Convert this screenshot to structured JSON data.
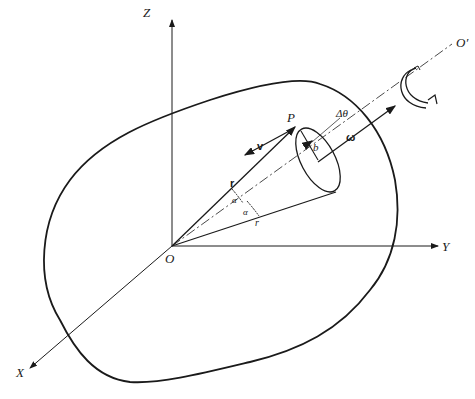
{
  "diagram": {
    "type": "rigid-body-rotation-vector-diagram",
    "colors": {
      "stroke": "#1a1a1a",
      "background": "#ffffff"
    },
    "axes": {
      "z": "Z",
      "y": "Y",
      "x": "X",
      "origin": "O"
    },
    "rotation_axis": {
      "label": "O′",
      "angular_velocity": "ω"
    },
    "point": {
      "label": "P",
      "position_vector": "r",
      "velocity_vector": "v",
      "radius_of_circle": "b",
      "angle_increment": "Δθ",
      "half_angle_1": "α",
      "half_angle_2": "α",
      "generator_label": "r"
    }
  }
}
